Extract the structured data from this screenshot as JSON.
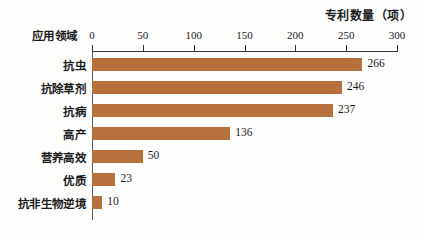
{
  "chart_data": {
    "type": "bar",
    "orientation": "horizontal",
    "title": "专利数量（项）",
    "xlabel": "",
    "ylabel": "应用领域",
    "categories": [
      "抗虫",
      "抗除草剂",
      "抗病",
      "高产",
      "营养高效",
      "优质",
      "抗非生物逆境"
    ],
    "values": [
      266,
      246,
      237,
      136,
      50,
      23,
      10
    ],
    "value_labels": [
      "266",
      "246",
      "237",
      "136",
      "50",
      "23",
      "10"
    ],
    "xlim": [
      0,
      300
    ],
    "ticks": [
      0,
      50,
      100,
      150,
      200,
      250,
      300
    ],
    "tick_labels": [
      "0",
      "50",
      "100",
      "150",
      "200",
      "250",
      "300"
    ],
    "grid": false,
    "legend": false,
    "axis_position": "top",
    "bar_color": "#b5703c",
    "background_color": "#fcfcfc",
    "text_color": "#1b1b1b"
  }
}
